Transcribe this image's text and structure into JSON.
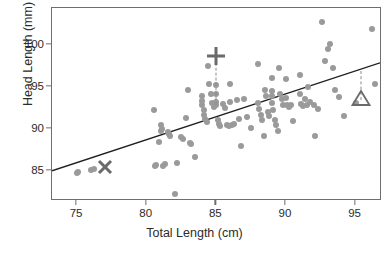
{
  "chart_data": {
    "type": "scatter",
    "title": "",
    "xlabel": "Total Length (cm)",
    "ylabel": "Head Length (mm)",
    "xlim": [
      73.2,
      96.9
    ],
    "ylim": [
      81.4,
      104.4
    ],
    "xticks": [
      75,
      80,
      85,
      90,
      95
    ],
    "yticks": [
      85,
      90,
      95,
      100
    ],
    "xtick_labels": [
      "75",
      "80",
      "85",
      "90",
      "95"
    ],
    "ytick_labels": [
      "85",
      "90",
      "95",
      "100"
    ],
    "grid": false,
    "legend": null,
    "point_color": "#9a9a9a",
    "line_color": "#1f1f1f",
    "frame_color": "#6e6e6e",
    "marker_color": "#6a6a6a",
    "series": [
      {
        "name": "possums",
        "marker": "circle",
        "points": [
          [
            75.0,
            84.7
          ],
          [
            75.1,
            84.8
          ],
          [
            76.0,
            85.1
          ],
          [
            76.2,
            85.2
          ],
          [
            80.5,
            92.3
          ],
          [
            80.6,
            85.6
          ],
          [
            80.7,
            85.7
          ],
          [
            80.9,
            88.4
          ],
          [
            81.0,
            90.5
          ],
          [
            81.0,
            89.8
          ],
          [
            81.1,
            90.0
          ],
          [
            81.2,
            85.6
          ],
          [
            81.3,
            85.8
          ],
          [
            81.5,
            89.6
          ],
          [
            81.6,
            89.4
          ],
          [
            81.7,
            89.1
          ],
          [
            82.0,
            82.2
          ],
          [
            82.2,
            85.9
          ],
          [
            82.5,
            89.0
          ],
          [
            82.6,
            88.8
          ],
          [
            82.8,
            91.3
          ],
          [
            83.0,
            94.6
          ],
          [
            83.1,
            88.3
          ],
          [
            83.2,
            88.2
          ],
          [
            83.5,
            86.6
          ],
          [
            84.0,
            93.9
          ],
          [
            84.0,
            93.3
          ],
          [
            84.0,
            92.8
          ],
          [
            84.1,
            92.3
          ],
          [
            84.1,
            91.6
          ],
          [
            84.2,
            91.2
          ],
          [
            84.3,
            90.8
          ],
          [
            84.4,
            97.5
          ],
          [
            84.5,
            95.4
          ],
          [
            84.6,
            94.2
          ],
          [
            84.7,
            93.1
          ],
          [
            84.8,
            92.6
          ],
          [
            85.0,
            95.2
          ],
          [
            85.0,
            94.1
          ],
          [
            85.0,
            93.2
          ],
          [
            85.0,
            92.9
          ],
          [
            85.1,
            91.0
          ],
          [
            85.2,
            90.6
          ],
          [
            85.3,
            90.3
          ],
          [
            85.5,
            93.0
          ],
          [
            85.6,
            92.5
          ],
          [
            85.8,
            90.5
          ],
          [
            85.9,
            90.3
          ],
          [
            86.0,
            95.4
          ],
          [
            86.0,
            93.2
          ],
          [
            86.1,
            90.4
          ],
          [
            86.3,
            90.6
          ],
          [
            86.5,
            93.4
          ],
          [
            86.6,
            91.2
          ],
          [
            86.8,
            87.9
          ],
          [
            87.0,
            93.5
          ],
          [
            87.2,
            91.4
          ],
          [
            87.5,
            90.1
          ],
          [
            88.0,
            97.7
          ],
          [
            88.0,
            93.1
          ],
          [
            88.1,
            92.4
          ],
          [
            88.2,
            91.6
          ],
          [
            88.3,
            91.1
          ],
          [
            88.4,
            89.2
          ],
          [
            88.5,
            94.6
          ],
          [
            88.6,
            93.9
          ],
          [
            88.7,
            92.0
          ],
          [
            88.8,
            91.5
          ],
          [
            89.0,
            96.0
          ],
          [
            89.0,
            94.5
          ],
          [
            89.0,
            93.9
          ],
          [
            89.0,
            93.1
          ],
          [
            89.1,
            92.2
          ],
          [
            89.2,
            91.0
          ],
          [
            89.3,
            90.4
          ],
          [
            89.4,
            89.7
          ],
          [
            89.5,
            97.2
          ],
          [
            89.6,
            94.2
          ],
          [
            89.7,
            93.6
          ],
          [
            89.8,
            92.8
          ],
          [
            90.0,
            95.9
          ],
          [
            90.0,
            93.7
          ],
          [
            90.1,
            92.9
          ],
          [
            90.2,
            92.6
          ],
          [
            90.4,
            92.8
          ],
          [
            90.5,
            90.9
          ],
          [
            91.0,
            96.4
          ],
          [
            91.0,
            94.2
          ],
          [
            91.1,
            93.0
          ],
          [
            91.2,
            92.7
          ],
          [
            91.4,
            93.6
          ],
          [
            91.5,
            92.9
          ],
          [
            91.6,
            95.0
          ],
          [
            91.7,
            93.2
          ],
          [
            92.0,
            92.9
          ],
          [
            92.1,
            89.1
          ],
          [
            92.3,
            92.4
          ],
          [
            92.6,
            102.7
          ],
          [
            92.8,
            98.1
          ],
          [
            93.0,
            99.5
          ],
          [
            93.2,
            100.1
          ],
          [
            93.4,
            97.2
          ],
          [
            93.5,
            94.6
          ],
          [
            93.8,
            93.8
          ],
          [
            94.2,
            91.5
          ],
          [
            95.0,
            93.1
          ],
          [
            96.2,
            101.9
          ],
          [
            96.4,
            95.4
          ]
        ]
      }
    ],
    "fit_line": {
      "type": "linear-regression",
      "x0": 73.2,
      "y0": 84.8,
      "x1": 96.9,
      "y1": 97.8
    },
    "annotations": [
      {
        "name": "x-marker",
        "glyph": "X",
        "x": 77.0,
        "y": 85.2,
        "dashed_to": null
      },
      {
        "name": "plus-marker",
        "glyph": "+",
        "x": 85.0,
        "y": 98.4,
        "dashed_to": 92.8
      },
      {
        "name": "triangle-marker",
        "glyph": "triangle",
        "x": 95.4,
        "y": 93.4,
        "dashed_to": 96.9
      }
    ]
  }
}
